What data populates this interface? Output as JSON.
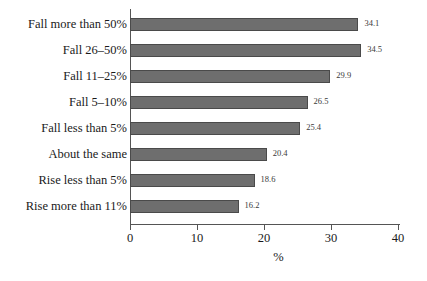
{
  "chart_data": {
    "type": "bar",
    "orientation": "horizontal",
    "title": "",
    "xlabel": "%",
    "ylabel": "",
    "xlim": [
      0,
      40
    ],
    "xticks": [
      0,
      10,
      20,
      30,
      40
    ],
    "xtick_labels": [
      "0",
      "10",
      "20",
      "30",
      "40"
    ],
    "grid": false,
    "legend": false,
    "categories": [
      "Fall more than 50%",
      "Fall 26–50%",
      "Fall 11–25%",
      "Fall 5–10%",
      "Fall less than 5%",
      "About the same",
      "Rise less than 5%",
      "Rise more than 11%"
    ],
    "values": [
      34.1,
      34.5,
      29.9,
      26.5,
      25.4,
      20.4,
      18.6,
      16.2
    ],
    "value_labels": [
      "34.1",
      "34.5",
      "29.9",
      "26.5",
      "25.4",
      "20.4",
      "18.6",
      "16.2"
    ],
    "bar_color": "#6e6e6e",
    "bar_edge_color": "#4a4a4a",
    "axis_color": "#555555",
    "background_color": "#ffffff"
  }
}
